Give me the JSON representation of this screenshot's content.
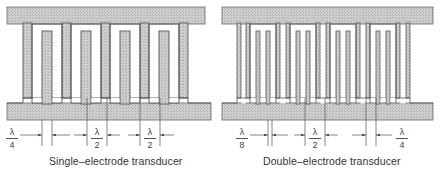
{
  "figure": {
    "left": {
      "caption": "Single–electrode transducer",
      "dimensions": [
        {
          "label_num": "λ",
          "label_den": "4"
        },
        {
          "label_num": "λ",
          "label_den": "2"
        },
        {
          "label_num": "λ",
          "label_den": "2"
        }
      ]
    },
    "right": {
      "caption": "Double–electrode transducer",
      "dimensions": [
        {
          "label_num": "λ",
          "label_den": "8"
        },
        {
          "label_num": "λ",
          "label_den": "2"
        },
        {
          "label_num": "λ",
          "label_den": "4"
        }
      ]
    },
    "colors": {
      "metal_fill": "#c8c8c8",
      "outline": "#555555",
      "background": "#ffffff"
    }
  }
}
